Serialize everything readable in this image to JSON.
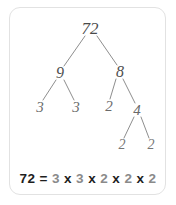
{
  "card": {
    "border_color": "#e2e2e2",
    "background_color": "#ffffff"
  },
  "diagram": {
    "type": "factor-tree",
    "line_color": "#8e8e8e",
    "nodes": [
      {
        "id": "root",
        "label": "72",
        "x": 90,
        "y": 28,
        "level": 0
      },
      {
        "id": "n9",
        "label": "9",
        "x": 60,
        "y": 73,
        "level": 1
      },
      {
        "id": "n8",
        "label": "8",
        "x": 120,
        "y": 72,
        "level": 1
      },
      {
        "id": "n3a",
        "label": "3",
        "x": 40,
        "y": 107,
        "level": 2
      },
      {
        "id": "n3b",
        "label": "3",
        "x": 76,
        "y": 107,
        "level": 2
      },
      {
        "id": "n2a",
        "label": "2",
        "x": 109,
        "y": 106,
        "level": 2
      },
      {
        "id": "n4",
        "label": "4",
        "x": 137,
        "y": 110,
        "level": 2
      },
      {
        "id": "n2b",
        "label": "2",
        "x": 122,
        "y": 145,
        "level": 3
      },
      {
        "id": "n2c",
        "label": "2",
        "x": 151,
        "y": 145,
        "level": 3
      }
    ],
    "edges": [
      {
        "from": "root",
        "to": "n9",
        "x1": 85,
        "y1": 36,
        "x2": 64,
        "y2": 66
      },
      {
        "from": "root",
        "to": "n8",
        "x1": 97,
        "y1": 36,
        "x2": 117,
        "y2": 65
      },
      {
        "from": "n9",
        "to": "n3a",
        "x1": 56,
        "y1": 80,
        "x2": 43,
        "y2": 100
      },
      {
        "from": "n9",
        "to": "n3b",
        "x1": 64,
        "y1": 80,
        "x2": 74,
        "y2": 100
      },
      {
        "from": "n8",
        "to": "n2a",
        "x1": 116,
        "y1": 79,
        "x2": 110,
        "y2": 99
      },
      {
        "from": "n8",
        "to": "n4",
        "x1": 123,
        "y1": 79,
        "x2": 135,
        "y2": 103
      },
      {
        "from": "n4",
        "to": "n2b",
        "x1": 134,
        "y1": 117,
        "x2": 124,
        "y2": 138
      },
      {
        "from": "n4",
        "to": "n2c",
        "x1": 141,
        "y1": 117,
        "x2": 149,
        "y2": 138
      }
    ]
  },
  "equation": {
    "lhs": "72",
    "operator_equals": "=",
    "operator_times": "x",
    "factors": [
      "3",
      "3",
      "2",
      "2",
      "2"
    ],
    "full_text": "72 = 3 x 3 x 2 x 2 x 2"
  }
}
